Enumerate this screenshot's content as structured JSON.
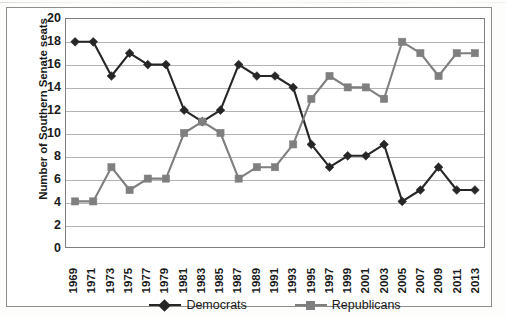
{
  "figure": {
    "background_color": "#ffffff",
    "border_color": "#8d8d8d",
    "plot_border_color": "#7e7e7e",
    "gridline_color": "#b3b3b3"
  },
  "chart_data": {
    "type": "line",
    "title": "",
    "subtitle": "",
    "xlabel": "",
    "ylabel": "Number of Southern Senate seats",
    "x": [
      1969,
      1971,
      1973,
      1975,
      1977,
      1979,
      1981,
      1983,
      1985,
      1987,
      1989,
      1991,
      1993,
      1995,
      1997,
      1999,
      2001,
      2003,
      2005,
      2007,
      2009,
      2011,
      2013
    ],
    "categories": [
      "1969",
      "1971",
      "1973",
      "1975",
      "1977",
      "1979",
      "1981",
      "1983",
      "1985",
      "1987",
      "1989",
      "1991",
      "1993",
      "1995",
      "1997",
      "1999",
      "2001",
      "2003",
      "2005",
      "2007",
      "2009",
      "2011",
      "2013"
    ],
    "series": [
      {
        "name": "Democrats",
        "color": "#262626",
        "marker": "diamond",
        "values": [
          18,
          18,
          15,
          17,
          16,
          16,
          12,
          11,
          12,
          16,
          15,
          15,
          14,
          9,
          7,
          8,
          8,
          9,
          4,
          5,
          7,
          5,
          5
        ]
      },
      {
        "name": "Republicans",
        "color": "#7f7f7f",
        "marker": "square",
        "values": [
          4,
          4,
          7,
          5,
          6,
          6,
          10,
          11,
          10,
          6,
          7,
          7,
          9,
          13,
          15,
          14,
          14,
          13,
          18,
          17,
          15,
          17,
          17
        ]
      }
    ],
    "ylim": [
      0,
      20
    ],
    "ytick_step": 2,
    "yticks": [
      20,
      18,
      16,
      14,
      12,
      10,
      8,
      6,
      4,
      2,
      0
    ],
    "grid": "horizontal",
    "legend_position": "bottom"
  },
  "legend": {
    "entries": [
      {
        "label": "Democrats",
        "color": "#262626",
        "marker": "diamond"
      },
      {
        "label": "Republicans",
        "color": "#7f7f7f",
        "marker": "square"
      }
    ]
  }
}
